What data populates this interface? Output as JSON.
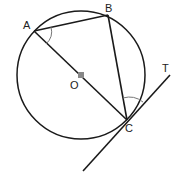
{
  "diagram": {
    "title": "",
    "circle": {
      "center_label": "O",
      "cx": 81,
      "cy": 75,
      "r": 64
    },
    "points": {
      "A": {
        "label": "A",
        "x": 34,
        "y": 31
      },
      "B": {
        "label": "B",
        "x": 108,
        "y": 15
      },
      "C": {
        "label": "C",
        "x": 127,
        "y": 120
      },
      "O": {
        "label": "O",
        "x": 81,
        "y": 75
      }
    },
    "tangent": {
      "label": "T",
      "x1": 83,
      "y1": 171,
      "x2": 170,
      "y2": 75
    },
    "segments": [
      "AB",
      "BC",
      "AC"
    ],
    "angle_marks": [
      "BAC",
      "BCT"
    ],
    "colors": {
      "line": "#1a1a1a",
      "arc": "#777777",
      "center_dot": "#888888"
    }
  }
}
